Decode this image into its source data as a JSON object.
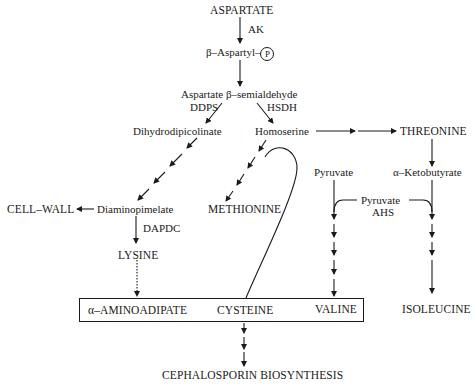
{
  "diagram": {
    "nodes": {
      "aspartate": "ASPARTATE",
      "aspartyl_p_prefix": "β–Aspartyl–",
      "phosphate_symbol": "P",
      "aspartate_semialdehyde": "Aspartate β–semialdehyde",
      "dihydrodipicolinate": "Dihydrodipicolinate",
      "homoserine": "Homoserine",
      "threonine": "THREONINE",
      "ketobutyrate": "α–Ketobutyrate",
      "pyruvate_left": "Pyruvate",
      "pyruvate_mid": "Pyruvate",
      "cell_wall": "CELL–WALL",
      "diaminopimelate": "Diaminopimelate",
      "methionine": "METHIONINE",
      "lysine": "LYSINE",
      "aminoadipate": "α–AMINOADIPATE",
      "cysteine": "CYSTEINE",
      "valine": "VALINE",
      "isoleucine": "ISOLEUCINE",
      "cephalosporin": "CEPHALOSPORIN BIOSYNTHESIS"
    },
    "enzymes": {
      "ak": "AK",
      "ddps": "DDPS",
      "hsdh": "HSDH",
      "dapdc": "DAPDC",
      "ahs": "AHS"
    },
    "edges": [
      {
        "from": "aspartate",
        "to": "aspartyl_p",
        "label": "AK",
        "style": "solid"
      },
      {
        "from": "aspartyl_p",
        "to": "aspartate_semialdehyde",
        "style": "solid"
      },
      {
        "from": "aspartate_semialdehyde",
        "to": "dihydrodipicolinate",
        "label": "DDPS",
        "style": "solid"
      },
      {
        "from": "aspartate_semialdehyde",
        "to": "homoserine",
        "label": "HSDH",
        "style": "solid"
      },
      {
        "from": "homoserine",
        "to": "threonine",
        "style": "multi-step"
      },
      {
        "from": "threonine",
        "to": "ketobutyrate",
        "style": "solid"
      },
      {
        "from": "dihydrodipicolinate",
        "to": "diaminopimelate",
        "style": "multi-step"
      },
      {
        "from": "diaminopimelate",
        "to": "cell_wall",
        "style": "solid"
      },
      {
        "from": "diaminopimelate",
        "to": "lysine",
        "label": "DAPDC",
        "style": "solid"
      },
      {
        "from": "lysine",
        "to": "aminoadipate",
        "style": "dotted"
      },
      {
        "from": "homoserine",
        "to": "methionine",
        "style": "multi-step"
      },
      {
        "from": "homoserine",
        "to": "cysteine",
        "style": "curved"
      },
      {
        "from": "pyruvate_left",
        "to": "valine",
        "label": "AHS",
        "cofactor": "Pyruvate",
        "style": "multi-step"
      },
      {
        "from": "ketobutyrate",
        "to": "isoleucine",
        "label": "AHS",
        "cofactor": "Pyruvate",
        "style": "multi-step"
      },
      {
        "from": "box",
        "to": "cephalosporin",
        "style": "multi-step"
      }
    ],
    "colors": {
      "ink": "#1a1a1a",
      "background": "#ffffff"
    }
  }
}
